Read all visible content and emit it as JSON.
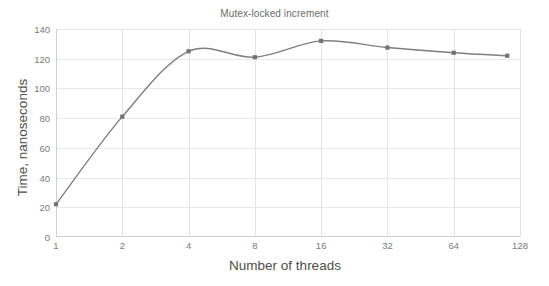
{
  "chart_data": {
    "type": "line",
    "title": "Mutex-locked increment",
    "xlabel": "Number of threads",
    "ylabel": "Time, nanoseconds",
    "x": [
      1,
      2,
      4,
      8,
      16,
      32,
      64,
      112
    ],
    "values": [
      22,
      81,
      125,
      121,
      132,
      127.5,
      124,
      122
    ],
    "categories": [
      "1",
      "2",
      "4",
      "8",
      "16",
      "32",
      "64",
      "112"
    ],
    "xticklabels": [
      "1",
      "2",
      "4",
      "8",
      "16",
      "32",
      "64",
      "128"
    ],
    "xtickvalues": [
      1,
      2,
      4,
      8,
      16,
      32,
      64,
      128
    ],
    "xscale": "log2",
    "xlim": [
      1,
      128
    ],
    "yticklabels": [
      "0",
      "20",
      "40",
      "60",
      "80",
      "100",
      "120",
      "140"
    ],
    "ytickvalues": [
      0,
      20,
      40,
      60,
      80,
      100,
      120,
      140
    ],
    "ylim": [
      0,
      140
    ],
    "grid": true,
    "legend": false,
    "series": [
      {
        "name": "Mutex-locked increment",
        "values": [
          22,
          81,
          125,
          121,
          132,
          127.5,
          124,
          122
        ]
      }
    ],
    "line_color": "#7f7f7f",
    "marker_color": "#737373",
    "marker": "square",
    "smoothing": true,
    "grid_color": "#e8e8e8",
    "axis_color": "#cfcfcf",
    "text_color": "#7a7a7a",
    "background": "#ffffff"
  }
}
